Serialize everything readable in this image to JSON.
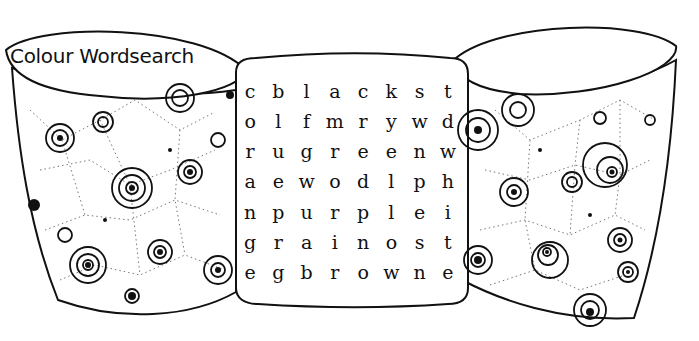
{
  "title": "Colour Wordsearch",
  "grid": [
    [
      "c",
      "b",
      "l",
      "a",
      "c",
      "k",
      "s",
      "t"
    ],
    [
      "o",
      "l",
      "f",
      "m",
      "r",
      "y",
      "w",
      "d"
    ],
    [
      "r",
      "u",
      "g",
      "r",
      "e",
      "e",
      "n",
      "w"
    ],
    [
      "a",
      "e",
      "w",
      "o",
      "d",
      "l",
      "p",
      "h"
    ],
    [
      "n",
      "p",
      "u",
      "r",
      "p",
      "l",
      "e",
      "i"
    ],
    [
      "g",
      "r",
      "a",
      "i",
      "n",
      "o",
      "s",
      "t"
    ],
    [
      "e",
      "g",
      "b",
      "r",
      "o",
      "w",
      "n",
      "e"
    ]
  ],
  "colors": {
    "ink": "#111111",
    "paper": "#ffffff"
  }
}
